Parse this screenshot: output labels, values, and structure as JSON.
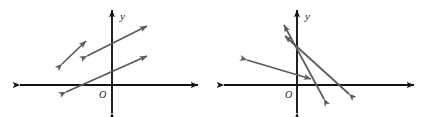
{
  "figure": {
    "background_color": "#ffffff",
    "axis_color": "#141414",
    "vector_color": "#5a5a5a",
    "label_color": "#1a1a1a",
    "width": 427,
    "height": 117
  },
  "panels": [
    {
      "id": "left",
      "name": "left-coordinate-plane",
      "origin": {
        "x": 112,
        "y": 85
      },
      "axes": {
        "x_axis": {
          "name": "x-axis",
          "x1": 20,
          "y1": 85,
          "x2": 198,
          "y2": 85,
          "arrow_start": true,
          "arrow_end": true
        },
        "y_axis": {
          "name": "y-axis",
          "x1": 112,
          "y1": 113,
          "x2": 112,
          "y2": 10,
          "arrow_start": true,
          "arrow_end": true
        }
      },
      "labels": {
        "y_label": {
          "text": "y",
          "x": 120,
          "y": 20
        },
        "origin_label": {
          "text": "O",
          "x": 99,
          "y": 98
        }
      },
      "vectors": [
        {
          "name": "vector-short-upper-left",
          "x1": 62,
          "y1": 64,
          "x2": 86,
          "y2": 41,
          "arrow_start": true,
          "arrow_end": true
        },
        {
          "name": "vector-long-upper",
          "x1": 87,
          "y1": 56,
          "x2": 147,
          "y2": 26,
          "arrow_start": true,
          "arrow_end": true
        },
        {
          "name": "vector-long-lower",
          "x1": 66,
          "y1": 92,
          "x2": 147,
          "y2": 56,
          "arrow_start": true,
          "arrow_end": true
        }
      ]
    },
    {
      "id": "right",
      "name": "right-coordinate-plane",
      "origin": {
        "x": 83,
        "y": 85
      },
      "axes": {
        "x_axis": {
          "name": "x-axis",
          "x1": 10,
          "y1": 85,
          "x2": 200,
          "y2": 85,
          "arrow_start": true,
          "arrow_end": true
        },
        "y_axis": {
          "name": "y-axis",
          "x1": 83,
          "y1": 113,
          "x2": 83,
          "y2": 10,
          "arrow_start": true,
          "arrow_end": true
        }
      },
      "labels": {
        "y_label": {
          "text": "y",
          "x": 91,
          "y": 20
        },
        "origin_label": {
          "text": "O",
          "x": 71,
          "y": 98
        }
      },
      "vectors": [
        {
          "name": "vector-steep-left",
          "x1": 110,
          "y1": 99,
          "x2": 70,
          "y2": 25,
          "arrow_start": true,
          "arrow_end": true
        },
        {
          "name": "vector-shallow-long",
          "x1": 135,
          "y1": 94,
          "x2": 71,
          "y2": 36,
          "arrow_start": true,
          "arrow_end": true
        },
        {
          "name": "vector-horizontal-shallow",
          "x1": 33,
          "y1": 60,
          "x2": 97,
          "y2": 79,
          "arrow_start": true,
          "arrow_end": true
        }
      ]
    }
  ]
}
